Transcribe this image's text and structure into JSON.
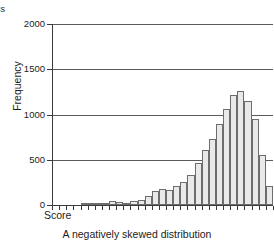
{
  "figure": {
    "cropped_top_text": "ss",
    "caption": "A negatively skewed distribution"
  },
  "axes": {
    "y_title": "Frequency",
    "x_title": "Score",
    "y_ticks": [
      "0",
      "500",
      "1000",
      "1500",
      "2000"
    ]
  },
  "colors": {
    "bar_fill": "#e9e9e9",
    "bar_stroke": "#6d6d6d",
    "axis": "#3a3a3a",
    "grid": "#5a5a5a",
    "text": "#1c1c1c",
    "background": "#ffffff"
  },
  "chart_data": {
    "type": "bar",
    "title": "A negatively skewed distribution",
    "xlabel": "Score",
    "ylabel": "Frequency",
    "ylim": [
      0,
      2000
    ],
    "yticks": [
      0,
      500,
      1000,
      1500,
      2000
    ],
    "grid": true,
    "legend": null,
    "x_tick_labels": [],
    "bin_count": 28,
    "categories": [
      "1",
      "2",
      "3",
      "4",
      "5",
      "6",
      "7",
      "8",
      "9",
      "10",
      "11",
      "12",
      "13",
      "14",
      "15",
      "16",
      "17",
      "18",
      "19",
      "20",
      "21",
      "22",
      "23",
      "24",
      "25",
      "26",
      "27",
      "28"
    ],
    "values": [
      0,
      0,
      0,
      0,
      5,
      10,
      12,
      15,
      40,
      38,
      20,
      45,
      60,
      95,
      150,
      175,
      170,
      215,
      250,
      330,
      460,
      610,
      730,
      895,
      1065,
      1215,
      1255,
      1145
    ],
    "values_tail": [
      945,
      550,
      210
    ],
    "annotations": [
      "negatively skewed: long left tail, peak near right edge"
    ]
  }
}
